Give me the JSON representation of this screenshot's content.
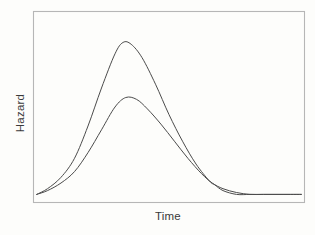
{
  "chart_data": {
    "type": "line",
    "title": "",
    "subtitle": "",
    "xlabel": "Time",
    "ylabel": "Hazard",
    "grid": false,
    "legend": null,
    "legend_position": "none",
    "x_tick_labels": [],
    "y_tick_labels": [],
    "xlim": [
      0,
      100
    ],
    "ylim": [
      0,
      100
    ],
    "annotations": [],
    "series": [
      {
        "name": "upper hazard curve",
        "color": "#4b4b4b",
        "peak_x": 33,
        "peak_y": 84,
        "x": [
          1,
          5,
          10,
          15,
          20,
          25,
          30,
          33,
          36,
          40,
          45,
          50,
          55,
          60,
          65,
          67,
          70,
          75,
          80,
          85,
          90,
          95,
          99
        ],
        "y": [
          4,
          7,
          13,
          23,
          40,
          60,
          78,
          84,
          83,
          76,
          62,
          46,
          32,
          20,
          11,
          9,
          6,
          4,
          4,
          4,
          4,
          4,
          4
        ]
      },
      {
        "name": "lower hazard curve",
        "color": "#4b4b4b",
        "peak_x": 34,
        "peak_y": 55,
        "x": [
          1,
          5,
          10,
          15,
          20,
          25,
          30,
          34,
          38,
          42,
          47,
          52,
          57,
          62,
          66,
          70,
          75,
          80,
          85,
          90,
          95,
          99
        ],
        "y": [
          4,
          6,
          10,
          16,
          26,
          38,
          50,
          55,
          54,
          49,
          41,
          32,
          23,
          15,
          10,
          7,
          5,
          4,
          4,
          4,
          4,
          4
        ]
      }
    ]
  },
  "figure": {
    "ylabel": "Hazard",
    "xlabel": "Time"
  }
}
